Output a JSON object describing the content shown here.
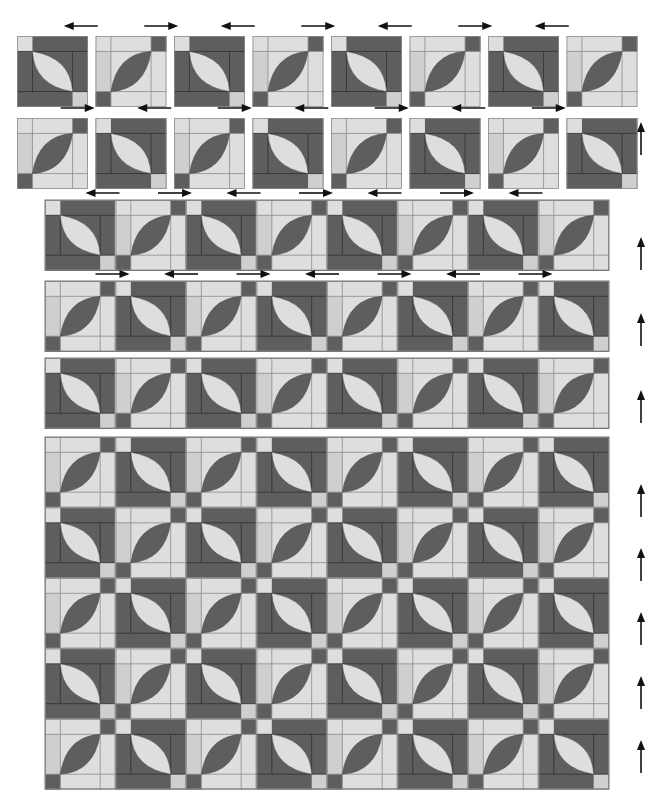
{
  "diagram": {
    "colors": {
      "dark": "#5e5e5e",
      "light": "#dedede",
      "medium": "#cfcfcf",
      "seam": "#2f2f2f",
      "seam_light": "#8a8a8a",
      "arrow": "#111111",
      "background": "#ffffff"
    },
    "block_types": {
      "A": {
        "name": "dark block",
        "background": "dark",
        "melon": "light",
        "melon_direction": "top-left to bottom-right",
        "corner_squares": [
          "top-left light",
          "bottom-right medium"
        ]
      },
      "B": {
        "name": "light block",
        "background": "light",
        "melon": "dark",
        "melon_direction": "bottom-left to top-right",
        "corner_squares": [
          "top-right dark",
          "bottom-left dark"
        ]
      }
    },
    "step1_separate_blocks": {
      "rows": [
        {
          "pattern": [
            "A",
            "B",
            "A",
            "B",
            "A",
            "B",
            "A",
            "B"
          ],
          "arrows_above": [
            "left",
            "right",
            "left",
            "right",
            "left",
            "right",
            "left"
          ]
        },
        {
          "pattern": [
            "B",
            "A",
            "B",
            "A",
            "B",
            "A",
            "B",
            "A"
          ],
          "arrows_above": [
            "right",
            "left",
            "right",
            "left",
            "right",
            "left",
            "right"
          ],
          "side_arrow": "up"
        }
      ]
    },
    "step2_sewn_rows": {
      "rows": [
        {
          "pattern": [
            "A",
            "B",
            "A",
            "B",
            "A",
            "B",
            "A",
            "B"
          ],
          "arrows_above": [
            "left",
            "right",
            "left",
            "right",
            "left",
            "right",
            "left"
          ],
          "side_arrow": "up"
        },
        {
          "pattern": [
            "B",
            "A",
            "B",
            "A",
            "B",
            "A",
            "B",
            "A"
          ],
          "arrows_above": [
            "right",
            "left",
            "right",
            "left",
            "right",
            "left",
            "right"
          ],
          "side_arrow": "up"
        },
        {
          "pattern": [
            "A",
            "B",
            "A",
            "B",
            "A",
            "B",
            "A",
            "B"
          ],
          "side_arrow": "up"
        }
      ]
    },
    "step3_assembled_quilt": {
      "rows": 8,
      "columns": 8,
      "row_patterns": [
        "B-start",
        "A-start",
        "B-start",
        "A-start",
        "B-start",
        "A-start",
        "B-start",
        "A-start"
      ],
      "side_arrows": [
        "up",
        "up",
        "up",
        "up",
        "up"
      ]
    }
  }
}
